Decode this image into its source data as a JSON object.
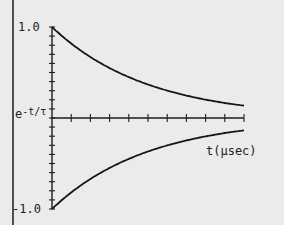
{
  "chart_data": {
    "type": "line",
    "title": "",
    "xlabel": "t(µsec)",
    "ylabel": "e^-t/τ",
    "ylabel_base": "e",
    "ylabel_exp": "-t/τ",
    "ytick_labels": [
      "1.0",
      "-1.0"
    ],
    "ylim": [
      -1.0,
      1.0
    ],
    "xlim": [
      0,
      10
    ],
    "x_tick_count": 10,
    "y_minor_tick_step": 0.1,
    "grid": false,
    "legend": null,
    "tau": 5,
    "x": [
      0,
      1,
      2,
      3,
      4,
      5,
      6,
      7,
      8,
      9,
      10
    ],
    "series": [
      {
        "name": "e^-t/τ",
        "values": [
          1.0,
          0.82,
          0.67,
          0.55,
          0.45,
          0.37,
          0.3,
          0.25,
          0.2,
          0.17,
          0.14
        ]
      },
      {
        "name": "-e^-t/τ",
        "values": [
          -1.0,
          -0.82,
          -0.67,
          -0.55,
          -0.45,
          -0.37,
          -0.3,
          -0.25,
          -0.2,
          -0.17,
          -0.14
        ]
      }
    ]
  }
}
